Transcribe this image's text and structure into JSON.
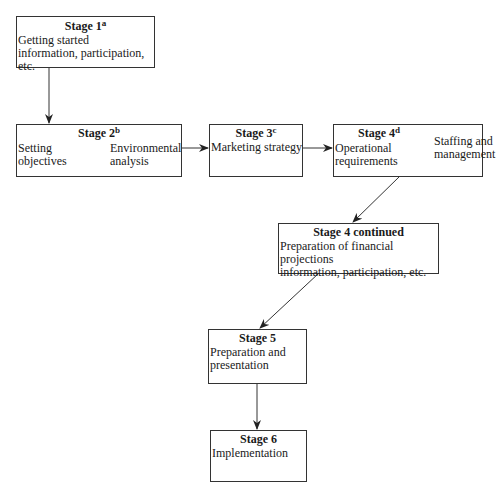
{
  "diagram": {
    "stages": [
      {
        "id": "stage1",
        "title": "Stage 1",
        "sup": "a",
        "lines": [
          "Getting started",
          "information, participation, etc."
        ]
      },
      {
        "id": "stage2",
        "title": "Stage 2",
        "sup": "b",
        "left": [
          "Setting",
          "objectives"
        ],
        "right": [
          "Environmental",
          "analysis"
        ]
      },
      {
        "id": "stage3",
        "title": "Stage 3",
        "sup": "c",
        "lines": [
          "Marketing strategy"
        ]
      },
      {
        "id": "stage4",
        "title": "Stage 4",
        "sup": "d",
        "left": [
          "Operational",
          "requirements"
        ],
        "right": [
          "Staffing and",
          "management"
        ]
      },
      {
        "id": "stage4c",
        "title": "Stage 4 continued",
        "lines": [
          "Preparation of financial projections",
          "information, participation, etc."
        ]
      },
      {
        "id": "stage5",
        "title": "Stage 5",
        "lines": [
          "Preparation and",
          "presentation"
        ]
      },
      {
        "id": "stage6",
        "title": "Stage 6",
        "lines": [
          "Implementation"
        ]
      }
    ],
    "edges": [
      [
        "stage1",
        "stage2"
      ],
      [
        "stage2",
        "stage3"
      ],
      [
        "stage3",
        "stage4"
      ],
      [
        "stage4",
        "stage4c"
      ],
      [
        "stage4c",
        "stage5"
      ],
      [
        "stage5",
        "stage6"
      ]
    ]
  }
}
